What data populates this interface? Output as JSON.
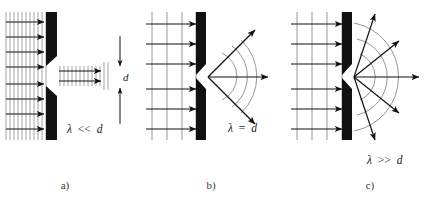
{
  "figure": {
    "background_color": "#ffffff",
    "ink_color": "#1a1a1a",
    "wavefront_color": "#9a9a9a",
    "barrier_color": "#111111",
    "arc_color": "#8f8f8f",
    "width": 431,
    "height": 201
  },
  "panels": [
    {
      "id": "a",
      "caption": "a)",
      "condition_label": "λ << d",
      "condition_lambda": "λ",
      "condition_relation": "<<",
      "condition_d": "d",
      "regime": "wavelength much smaller than slit width",
      "incident_wavefront_count": 11,
      "incident_ray_count": 8,
      "transmitted_wavefront_count": 12,
      "transmitted_ray_count": 2,
      "diffraction_spread_degrees": 0,
      "output_type": "collimated-beam",
      "dimension_marker": {
        "label": "d",
        "meaning": "slit width"
      }
    },
    {
      "id": "b",
      "caption": "b)",
      "condition_label": "λ = d",
      "condition_lambda": "λ",
      "condition_relation": "=",
      "condition_d": "d",
      "regime": "wavelength equal to slit width",
      "incident_wavefront_count": 4,
      "incident_ray_count": 6,
      "arc_count": 3,
      "ray_count": 3,
      "ray_angles_degrees": [
        -45,
        0,
        45
      ],
      "diffraction_spread_degrees": 90,
      "output_type": "moderate-circular-spread"
    },
    {
      "id": "c",
      "caption": "c)",
      "condition_label": "λ >> d",
      "condition_lambda": "λ",
      "condition_relation": ">>",
      "condition_d": "d",
      "regime": "wavelength much larger than slit width",
      "incident_wavefront_count": 4,
      "incident_ray_count": 6,
      "arc_count": 3,
      "ray_count": 5,
      "ray_angles_degrees": [
        -72,
        -38,
        0,
        38,
        72
      ],
      "diffraction_spread_degrees": 144,
      "output_type": "wide-circular-spread"
    }
  ]
}
